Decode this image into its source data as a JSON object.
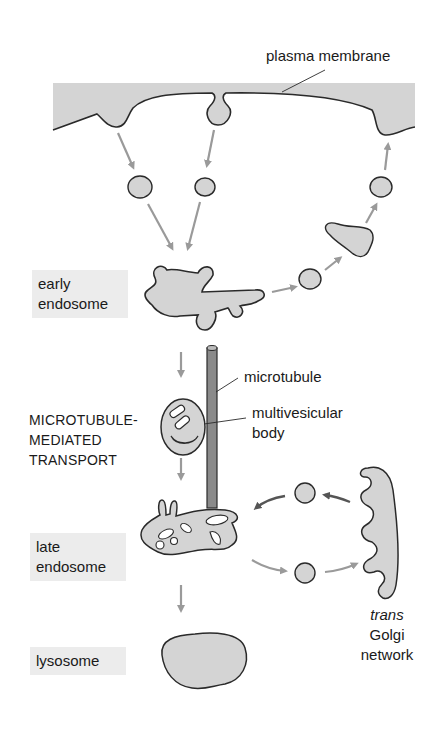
{
  "diagram": {
    "labels": {
      "plasma_membrane": "plasma membrane",
      "early_endosome_line1": "early",
      "early_endosome_line2": "endosome",
      "microtubule": "microtubule",
      "multivesicular_line1": "multivesicular",
      "multivesicular_line2": "body",
      "transport_line1": "MICROTUBULE-",
      "transport_line2": "MEDIATED",
      "transport_line3": "TRANSPORT",
      "late_endosome_line1": "late",
      "late_endosome_line2": "endosome",
      "lysosome": "lysosome",
      "golgi_line1": "trans",
      "golgi_line2": "Golgi",
      "golgi_line3": "network"
    },
    "colors": {
      "fill": "#d4d4d4",
      "outline": "#2a2a2a",
      "arrow_light": "#9a9a9a",
      "arrow_dark": "#555555",
      "label_box": "#ececec",
      "microtubule": "#8a8a8a"
    }
  }
}
